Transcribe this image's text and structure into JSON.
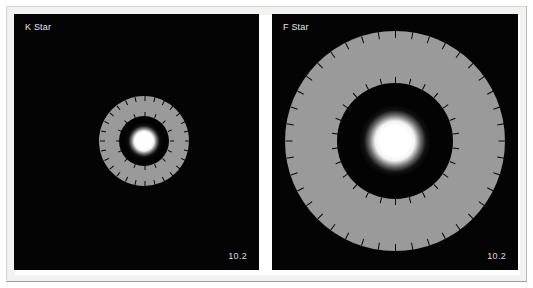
{
  "figure": {
    "background_color": "#ffffff",
    "frame_color": "#f2f2f0"
  },
  "chart_data": {
    "type": "diagram",
    "title": "",
    "panel_background": "#030303",
    "annulus_color": "#9a9a9a",
    "star_color": "#ffffff",
    "tick_color": "#060606",
    "panels": [
      {
        "label": "K Star",
        "corner_value": "10.2",
        "center_x": 130,
        "center_y": 127,
        "outer_radius": 45,
        "inner_radius": 25,
        "star_radius": 7,
        "outer_tick_count": 28,
        "inner_tick_count": 16,
        "outer_tick_length": 5,
        "inner_tick_length": 4
      },
      {
        "label": "F Star",
        "corner_value": "10.2",
        "center_x": 123,
        "center_y": 127,
        "outer_radius": 110,
        "inner_radius": 58,
        "star_radius": 14,
        "outer_tick_count": 40,
        "inner_tick_count": 26,
        "outer_tick_length": 7,
        "inner_tick_length": 6
      }
    ]
  }
}
